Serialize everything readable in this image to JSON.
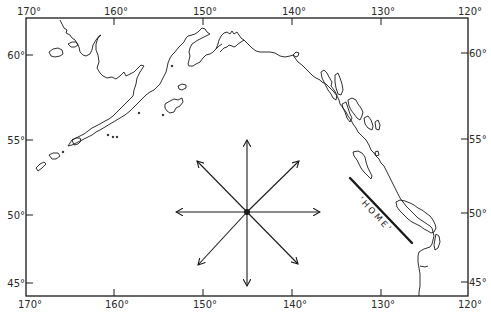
{
  "map": {
    "type": "regional outline map",
    "region": "North-East Pacific Ocean, Gulf of Alaska",
    "frame": {
      "left": 26,
      "top": 18,
      "right": 468,
      "bottom": 296
    },
    "ink_color": "#1a1a1a",
    "background": "#ffffff",
    "longitude_axis": {
      "top_labels": [
        {
          "label": "170°",
          "x": 26
        },
        {
          "label": "160°",
          "x": 114
        },
        {
          "label": "150°",
          "x": 203
        },
        {
          "label": "140°",
          "x": 292
        },
        {
          "label": "130°",
          "x": 381
        },
        {
          "label": "120°",
          "x": 468
        }
      ],
      "bottom_labels": [
        {
          "label": "170°",
          "x": 26
        },
        {
          "label": "160°",
          "x": 114
        },
        {
          "label": "150°",
          "x": 203
        },
        {
          "label": "140°",
          "x": 292
        },
        {
          "label": "130°",
          "x": 381
        },
        {
          "label": "120°",
          "x": 468
        }
      ]
    },
    "latitude_axis": {
      "left_labels": [
        {
          "label": "60°",
          "y": 55
        },
        {
          "label": "55°",
          "y": 140
        },
        {
          "label": "50°",
          "y": 215
        },
        {
          "label": "45°",
          "y": 283
        }
      ],
      "right_labels": [
        {
          "label": "60°",
          "y": 53
        },
        {
          "label": "55°",
          "y": 139
        },
        {
          "label": "50°",
          "y": 213
        },
        {
          "label": "45°",
          "y": 282
        }
      ]
    },
    "compass_rose": {
      "center": {
        "x": 247,
        "y": 212
      },
      "directions": [
        "N",
        "NE",
        "E",
        "SE",
        "S",
        "SW",
        "W",
        "NW"
      ]
    },
    "home_marker": {
      "label": "'HOME'",
      "line_start": {
        "x": 350,
        "y": 178
      },
      "line_end": {
        "x": 412,
        "y": 243
      }
    }
  }
}
